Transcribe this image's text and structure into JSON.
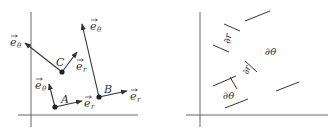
{
  "left_panel": {
    "points": [
      {
        "name": "A",
        "label": "A"
      },
      {
        "name": "B",
        "label": "B"
      },
      {
        "name": "C",
        "label": "C"
      }
    ],
    "vector_labels": {
      "er": "e⃗ r",
      "etheta": "e⃗ θ"
    },
    "labels": {
      "C_etheta": "e",
      "C_etheta_sub": "θ",
      "C_er": "e",
      "C_er_sub": "r",
      "B_etheta": "e",
      "B_etheta_sub": "θ",
      "B_er": "e",
      "B_er_sub": "r",
      "A_etheta": "e",
      "A_etheta_sub": "θ",
      "A_er": "e",
      "A_er_sub": "r",
      "A": "A",
      "B": "B",
      "C": "C"
    }
  },
  "right_panel": {
    "labels": {
      "dr_top": "∂r",
      "dtheta_right": "∂θ",
      "dr_mid": "∂r",
      "dtheta_bottom": "∂θ"
    }
  },
  "colors": {
    "line": "#333333",
    "axis": "#555555",
    "background": "#ffffff"
  }
}
